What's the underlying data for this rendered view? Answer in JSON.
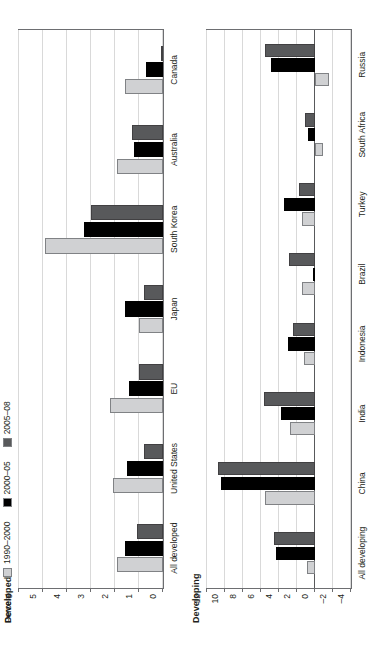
{
  "legend": {
    "items": [
      {
        "label": "1990–2000",
        "color": "#d0d1d3",
        "key": "s0"
      },
      {
        "label": "2000–05",
        "color": "#000000",
        "key": "s1"
      },
      {
        "label": "2005–08",
        "color": "#58595b",
        "key": "s2"
      }
    ]
  },
  "axis_unit_label": "Percent",
  "panels": {
    "developed": {
      "title": "Developed"
    },
    "developing": {
      "title": "Developing"
    }
  },
  "chart_data": [
    {
      "type": "bar",
      "title": "Developed",
      "xlabel": "",
      "ylabel": "Percent",
      "ylim": [
        0,
        6
      ],
      "yticks": [
        0,
        1,
        2,
        3,
        4,
        5,
        6
      ],
      "ytick_labels": [
        "0",
        "1",
        "2",
        "3",
        "4",
        "5",
        "6"
      ],
      "grid": true,
      "legend_position": "top-left",
      "categories": [
        "All developed",
        "United States",
        "EU",
        "Japan",
        "South Korea",
        "Australia",
        "Canada"
      ],
      "series": [
        {
          "name": "1990–2000",
          "color": "#d0d1d3",
          "values": [
            1.9,
            2.1,
            2.2,
            1.0,
            4.9,
            1.9,
            1.6
          ]
        },
        {
          "name": "2000–05",
          "color": "#000000",
          "values": [
            1.6,
            1.5,
            1.4,
            1.6,
            3.3,
            1.2,
            0.7
          ]
        },
        {
          "name": "2005–08",
          "color": "#58595b",
          "values": [
            1.1,
            0.8,
            1.0,
            0.8,
            3.0,
            1.3,
            0.05
          ]
        }
      ]
    },
    {
      "type": "bar",
      "title": "Developing",
      "xlabel": "",
      "ylabel": "",
      "ylim": [
        -4,
        12
      ],
      "yticks": [
        -4,
        -2,
        0,
        2,
        4,
        6,
        8,
        10,
        12
      ],
      "ytick_labels": [
        "–4",
        "–2",
        "0",
        "2",
        "4",
        "6",
        "8",
        "10",
        "12"
      ],
      "grid": true,
      "legend_position": "none",
      "categories": [
        "All developing",
        "China",
        "India",
        "Indonesia",
        "Brazil",
        "Turkey",
        "South Africa",
        "Russia"
      ],
      "series": [
        {
          "name": "1990–2000",
          "color": "#d0d1d3",
          "values": [
            0.9,
            5.6,
            2.8,
            1.2,
            1.5,
            1.4,
            -0.9,
            -1.6
          ]
        },
        {
          "name": "2000–05",
          "color": "#000000",
          "values": [
            4.3,
            10.4,
            3.8,
            3.0,
            0.1,
            3.4,
            0.8,
            4.9
          ]
        },
        {
          "name": "2005–08",
          "color": "#58595b",
          "values": [
            4.6,
            10.8,
            5.7,
            2.5,
            2.9,
            1.8,
            1.1,
            5.6
          ]
        }
      ]
    }
  ]
}
